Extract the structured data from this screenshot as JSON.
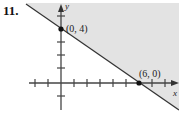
{
  "problem": {
    "number": "11."
  },
  "graph": {
    "type": "linear-inequality",
    "axes": {
      "x_label": "x",
      "y_label": "y"
    },
    "boundary": {
      "style": "solid",
      "through": [
        [
          0,
          4
        ],
        [
          6,
          0
        ]
      ]
    },
    "shaded_side": "above-right",
    "shade_color": "#e3e3e3",
    "line_color": "#333333",
    "points": [
      {
        "label": "(0, 4)",
        "x": 0,
        "y": 4
      },
      {
        "label": "(6, 0)",
        "x": 6,
        "y": 0
      }
    ],
    "x_ticks": [
      -2,
      -1,
      1,
      2,
      3,
      4,
      5,
      6,
      7,
      8
    ],
    "y_ticks": [
      -3,
      -2,
      -1,
      1,
      2,
      3,
      4,
      5
    ]
  }
}
